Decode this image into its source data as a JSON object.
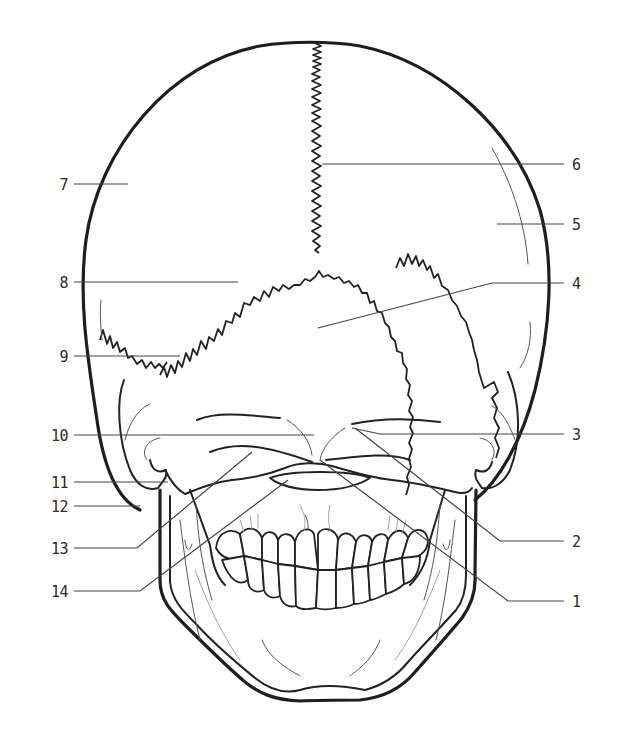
{
  "diagram": {
    "line_color": "#222222",
    "background": "#ffffff",
    "callouts": [
      {
        "number": "1",
        "side": "right",
        "label_x": 572,
        "label_y": 601
      },
      {
        "number": "2",
        "side": "right",
        "label_x": 572,
        "label_y": 541
      },
      {
        "number": "3",
        "side": "right",
        "label_x": 572,
        "label_y": 434
      },
      {
        "number": "4",
        "side": "right",
        "label_x": 572,
        "label_y": 283
      },
      {
        "number": "5",
        "side": "right",
        "label_x": 572,
        "label_y": 224
      },
      {
        "number": "6",
        "side": "right",
        "label_x": 572,
        "label_y": 164
      },
      {
        "number": "7",
        "side": "left",
        "label_x": 58,
        "label_y": 184
      },
      {
        "number": "8",
        "side": "left",
        "label_x": 58,
        "label_y": 282
      },
      {
        "number": "9",
        "side": "left",
        "label_x": 58,
        "label_y": 356
      },
      {
        "number": "10",
        "side": "left",
        "label_x": 52,
        "label_y": 435
      },
      {
        "number": "11",
        "side": "left",
        "label_x": 52,
        "label_y": 482
      },
      {
        "number": "12",
        "side": "left",
        "label_x": 52,
        "label_y": 506
      },
      {
        "number": "13",
        "side": "left",
        "label_x": 52,
        "label_y": 548
      },
      {
        "number": "14",
        "side": "left",
        "label_x": 52,
        "label_y": 591
      }
    ]
  }
}
